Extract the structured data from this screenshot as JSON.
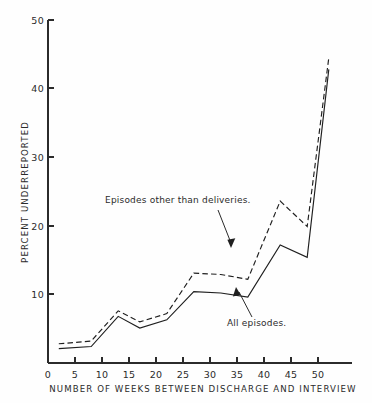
{
  "chart_data": {
    "type": "line",
    "title": "",
    "xlabel": "NUMBER OF WEEKS BETWEEN DISCHARGE AND INTERVIEW",
    "ylabel": "PERCENT UNDERREPORTED",
    "xlim": [
      0,
      54
    ],
    "ylim": [
      0,
      50
    ],
    "xticks": [
      0,
      5,
      10,
      15,
      20,
      25,
      30,
      35,
      40,
      45,
      50
    ],
    "xtick_labels": [
      "0",
      "5",
      "10",
      "15",
      "20",
      "25",
      "30",
      "35",
      "40",
      "45",
      "50"
    ],
    "yticks": [
      10,
      20,
      30,
      40,
      50
    ],
    "ytick_labels": [
      "10",
      "20",
      "30",
      "40",
      "50"
    ],
    "grid": false,
    "legend": "inline-annotations",
    "series": [
      {
        "name": "Episodes other than deliveries.",
        "style": "dashed",
        "x": [
          2,
          8,
          13,
          17,
          22,
          27,
          32,
          37,
          43,
          48,
          52
        ],
        "values": [
          2.8,
          3.2,
          7.6,
          6.0,
          7.2,
          13.1,
          12.9,
          12.2,
          23.6,
          19.9,
          44.5
        ]
      },
      {
        "name": "All episodes.",
        "style": "solid",
        "x": [
          2,
          8,
          13,
          17,
          22,
          27,
          32,
          37,
          43,
          48,
          52
        ],
        "values": [
          2.1,
          2.4,
          6.8,
          5.1,
          6.3,
          10.4,
          10.2,
          9.6,
          17.2,
          15.4,
          42.8
        ]
      }
    ],
    "annotations": [
      {
        "text": "Episodes other than deliveries.",
        "target_series": "Episodes other than deliveries.",
        "target_x": 40,
        "target_y": 17
      },
      {
        "text": "All episodes.",
        "target_series": "All episodes.",
        "target_x": 38,
        "target_y": 11
      }
    ]
  },
  "axes": {
    "y_title": "PERCENT UNDERREPORTED",
    "x_title": "NUMBER OF WEEKS BETWEEN DISCHARGE AND INTERVIEW",
    "y_tick_50": "50",
    "y_tick_40": "40",
    "y_tick_30": "30",
    "y_tick_20": "20",
    "y_tick_10": "10",
    "x_tick_0": "0",
    "x_tick_5": "5",
    "x_tick_10": "10",
    "x_tick_15": "15",
    "x_tick_20": "20",
    "x_tick_25": "25",
    "x_tick_30": "30",
    "x_tick_35": "35",
    "x_tick_40": "40",
    "x_tick_45": "45",
    "x_tick_50": "50"
  },
  "annotations": {
    "upper_label": "Episodes other than deliveries.",
    "lower_label": "All episodes."
  }
}
